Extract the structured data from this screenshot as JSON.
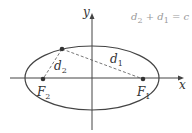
{
  "diagram": {
    "axes": {
      "x_label": "x",
      "y_label": "y"
    },
    "foci": [
      {
        "name": "F",
        "sub": "2"
      },
      {
        "name": "F",
        "sub": "1"
      }
    ],
    "distances": [
      {
        "name": "d",
        "sub": "2"
      },
      {
        "name": "d",
        "sub": "1"
      }
    ],
    "equation": {
      "d2": "d",
      "d2_sub": "2",
      "plus": " + ",
      "d1": "d",
      "d1_sub": "1",
      "rest": " = c"
    },
    "colors": {
      "stroke": "#444444",
      "equation": "#999999"
    }
  }
}
